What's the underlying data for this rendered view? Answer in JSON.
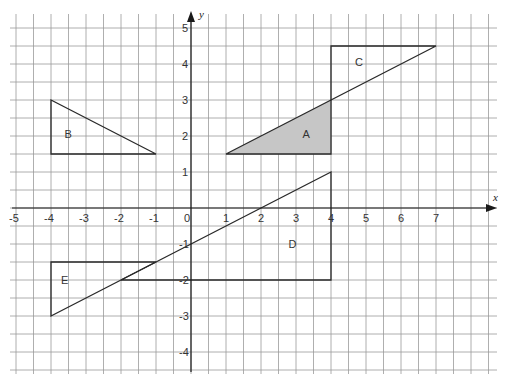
{
  "diagram": {
    "type": "coordinate-grid",
    "colors": {
      "background": "#ffffff",
      "grid_line": "#9a9a9a",
      "axis_line": "#1a1a1a",
      "shape_stroke": "#2a2a2a",
      "shaded_fill": "#c6c6c6"
    },
    "axes": {
      "x_label": "x",
      "y_label": "y",
      "x_range": [
        -5,
        8.6
      ],
      "y_range": [
        -4.5,
        5.5
      ],
      "grid_step": 0.5,
      "x_ticks": [
        {
          "value": -5,
          "label": "-5"
        },
        {
          "value": -4,
          "label": "-4"
        },
        {
          "value": -3,
          "label": "-3"
        },
        {
          "value": -2,
          "label": "-2"
        },
        {
          "value": -1,
          "label": "-1"
        },
        {
          "value": 0,
          "label": "0"
        },
        {
          "value": 1,
          "label": "1"
        },
        {
          "value": 2,
          "label": "2"
        },
        {
          "value": 3,
          "label": "3"
        },
        {
          "value": 4,
          "label": "4"
        },
        {
          "value": 5,
          "label": "5"
        },
        {
          "value": 6,
          "label": "6"
        },
        {
          "value": 7,
          "label": "7"
        }
      ],
      "y_ticks": [
        {
          "value": 5,
          "label": "5"
        },
        {
          "value": 4,
          "label": "4"
        },
        {
          "value": 3,
          "label": "3"
        },
        {
          "value": 2,
          "label": "2"
        },
        {
          "value": 1,
          "label": "1"
        },
        {
          "value": -1,
          "label": "-1"
        },
        {
          "value": -2,
          "label": "-2"
        },
        {
          "value": -3,
          "label": "-3"
        },
        {
          "value": -4,
          "label": "-4"
        }
      ]
    },
    "shapes": [
      {
        "id": "A",
        "label": "A",
        "shaded": true,
        "vertices": [
          [
            1,
            1.5
          ],
          [
            4,
            1.5
          ],
          [
            4,
            3
          ]
        ],
        "label_pos": [
          3.3,
          2.05
        ]
      },
      {
        "id": "B",
        "label": "B",
        "shaded": false,
        "vertices": [
          [
            -4,
            3
          ],
          [
            -4,
            1.5
          ],
          [
            -1,
            1.5
          ]
        ],
        "label_pos": [
          -3.5,
          2.05
        ]
      },
      {
        "id": "C",
        "label": "C",
        "shaded": false,
        "vertices": [
          [
            4,
            3
          ],
          [
            4,
            4.5
          ],
          [
            7,
            4.5
          ]
        ],
        "label_pos": [
          4.8,
          4.05
        ]
      },
      {
        "id": "D",
        "label": "D",
        "shaded": false,
        "vertices": [
          [
            -2,
            -2
          ],
          [
            4,
            -2
          ],
          [
            4,
            1
          ]
        ],
        "label_pos": [
          2.9,
          -1.0
        ]
      },
      {
        "id": "E",
        "label": "E",
        "shaded": false,
        "vertices": [
          [
            -4,
            -1.5
          ],
          [
            -1,
            -1.5
          ],
          [
            -4,
            -3
          ]
        ],
        "label_pos": [
          -3.6,
          -2.0
        ]
      }
    ]
  }
}
